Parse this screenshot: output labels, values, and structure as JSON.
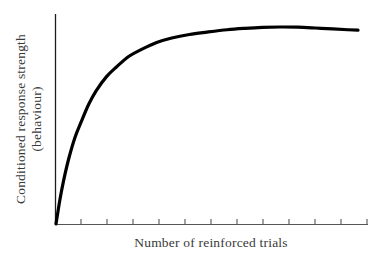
{
  "figure": {
    "background_color": "#ffffff",
    "curve_color": "#000000",
    "axis_color": "#4a4a4a",
    "label_color": "#3a3a3a"
  },
  "chart_data": {
    "type": "line",
    "title": "",
    "subtitle": "",
    "xlabel": "Number of reinforced trials",
    "ylabel_line1": "Conditioned response strength",
    "ylabel_line2": "(behaviour)",
    "ylabel": "Conditioned response strength (behaviour)",
    "grid": false,
    "legend": null,
    "legend_position": "none",
    "xlim": [
      0,
      12
    ],
    "ylim": [
      0,
      1.08
    ],
    "x_tick_labels": [
      "",
      "",
      "",
      "",
      "",
      "",
      "",
      "",
      "",
      "",
      "",
      ""
    ],
    "y_tick_labels": [],
    "x_tick_count": 12,
    "annotations": [],
    "series": [
      {
        "name": "acquisition curve",
        "description": "negatively accelerated learning curve approaching asymptote",
        "x": [
          0.0,
          0.15,
          0.3,
          0.5,
          0.75,
          1.0,
          1.3,
          1.6,
          2.0,
          2.4,
          2.9,
          3.4,
          4.0,
          4.6,
          5.3,
          6.0,
          6.8,
          7.5,
          8.2,
          8.9,
          9.6,
          10.3,
          11.0,
          11.6,
          12.0
        ],
        "y": [
          0.0,
          0.12,
          0.22,
          0.33,
          0.44,
          0.52,
          0.61,
          0.68,
          0.75,
          0.8,
          0.855,
          0.89,
          0.925,
          0.948,
          0.966,
          0.978,
          0.99,
          0.997,
          1.002,
          1.004,
          1.003,
          0.999,
          0.994,
          0.99,
          0.988
        ]
      }
    ]
  },
  "labels": {
    "x_axis": "Number of reinforced trials",
    "y_axis_line1": "Conditioned response strength",
    "y_axis_line2": "(behaviour)"
  }
}
